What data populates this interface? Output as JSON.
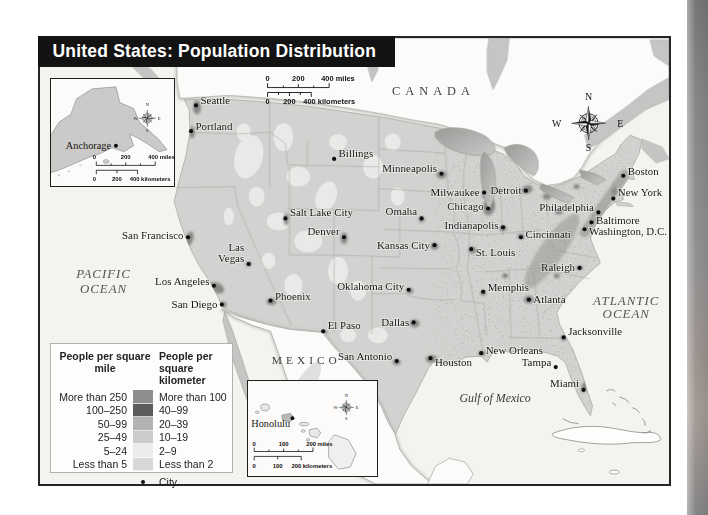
{
  "title": "United States: Population Distribution",
  "compass": {
    "n": "N",
    "e": "E",
    "s": "S",
    "w": "W"
  },
  "map": {
    "region_labels": {
      "canada": "CANADA",
      "mexico": "MEXICO",
      "pacific_1": "PACIFIC",
      "pacific_2": "OCEAN",
      "atlantic_1": "ATLANTIC",
      "atlantic_2": "OCEAN",
      "gulf": "Gulf of Mexico"
    },
    "scale": {
      "mi": [
        "0",
        "200",
        "400 miles"
      ],
      "km": [
        "0",
        "200",
        "400 kilometers"
      ]
    },
    "cities": [
      {
        "name": "Seattle",
        "x": 157,
        "y": 68,
        "side": "right",
        "dy": -1
      },
      {
        "name": "Portland",
        "x": 152,
        "y": 94,
        "side": "right",
        "dy": -1
      },
      {
        "name": "Billings",
        "x": 296,
        "y": 122,
        "side": "right",
        "dy": -2
      },
      {
        "name": "Minneapolis",
        "x": 404,
        "y": 137,
        "side": "left",
        "dy": -2
      },
      {
        "name": "Milwaukee",
        "x": 447,
        "y": 156,
        "side": "left"
      },
      {
        "name": "Detroit",
        "x": 489,
        "y": 154,
        "side": "left"
      },
      {
        "name": "Chicago",
        "x": 451,
        "y": 172,
        "side": "left",
        "dy": 2
      },
      {
        "name": "Omaha",
        "x": 384,
        "y": 182,
        "side": "left",
        "dy": -3
      },
      {
        "name": "Salt Lake City",
        "x": 247,
        "y": 182,
        "side": "right",
        "dy": -2
      },
      {
        "name": "Denver",
        "x": 306,
        "y": 201,
        "side": "left",
        "dy": -2
      },
      {
        "name": "San Francisco",
        "x": 149,
        "y": 201,
        "side": "left",
        "dy": 2
      },
      {
        "name": "Las Vegas",
        "x": 210,
        "y": 228,
        "side": "left",
        "dy": -13,
        "lines": [
          "Las",
          "Vegas"
        ]
      },
      {
        "name": "Los Angeles",
        "x": 175,
        "y": 250,
        "side": "left",
        "dy": -1
      },
      {
        "name": "San Diego",
        "x": 183,
        "y": 269,
        "side": "left"
      },
      {
        "name": "Phoenix",
        "x": 232,
        "y": 265,
        "side": "right",
        "dy": -1
      },
      {
        "name": "Kansas City",
        "x": 397,
        "y": 209,
        "side": "left"
      },
      {
        "name": "Indianapolis",
        "x": 466,
        "y": 191,
        "side": "left",
        "dy": 2
      },
      {
        "name": "Cincinnati",
        "x": 484,
        "y": 201,
        "side": "right",
        "dy": 1
      },
      {
        "name": "St. Louis",
        "x": 434,
        "y": 213,
        "side": "right",
        "dy": 7
      },
      {
        "name": "Philadelphia",
        "x": 562,
        "y": 176,
        "side": "left",
        "dy": -1
      },
      {
        "name": "New York",
        "x": 577,
        "y": 162,
        "side": "right",
        "dy": -3
      },
      {
        "name": "Boston",
        "x": 587,
        "y": 139,
        "side": "right",
        "dy": -1
      },
      {
        "name": "Baltimore",
        "x": 555,
        "y": 186,
        "side": "right",
        "dy": 2
      },
      {
        "name": "Washington, D.C.",
        "x": 548,
        "y": 193,
        "side": "right",
        "dy": 6
      },
      {
        "name": "Raleigh",
        "x": 543,
        "y": 232,
        "side": "left"
      },
      {
        "name": "Oklahoma City",
        "x": 371,
        "y": 254,
        "side": "left",
        "dy": 0
      },
      {
        "name": "Memphis",
        "x": 446,
        "y": 256,
        "side": "right",
        "dy": -1
      },
      {
        "name": "Atlanta",
        "x": 492,
        "y": 264,
        "side": "right"
      },
      {
        "name": "El Paso",
        "x": 285,
        "y": 296,
        "side": "right",
        "dy": -2
      },
      {
        "name": "Dallas",
        "x": 376,
        "y": 287,
        "side": "left"
      },
      {
        "name": "San Antonio",
        "x": 359,
        "y": 326,
        "side": "left",
        "dy": -1
      },
      {
        "name": "Houston",
        "x": 393,
        "y": 323,
        "side": "right",
        "dy": 8
      },
      {
        "name": "New Orleans",
        "x": 444,
        "y": 318,
        "side": "right",
        "dy": 1
      },
      {
        "name": "Jacksonville",
        "x": 527,
        "y": 302,
        "side": "right",
        "dy": -2
      },
      {
        "name": "Tampa",
        "x": 519,
        "y": 332,
        "side": "left",
        "dy": -1
      },
      {
        "name": "Miami",
        "x": 547,
        "y": 355,
        "side": "left",
        "dy": -3
      }
    ]
  },
  "insets": {
    "alaska": {
      "city": "Anchorage",
      "scale_mi": [
        "0",
        "200",
        "400 miles"
      ],
      "scale_km": [
        "0",
        "200",
        "400 kilometers"
      ]
    },
    "hawaii": {
      "city": "Honolulu",
      "scale_mi": [
        "0",
        "100",
        "200 miles"
      ],
      "scale_km": [
        "0",
        "100",
        "200 kilometers"
      ]
    }
  },
  "legend": {
    "col1_header": "People per square mile",
    "col2_header": "People per square kilometer",
    "rows": [
      {
        "mile": "More than 250",
        "km": "More than 100",
        "color": "#8e8e8c"
      },
      {
        "mile": "100–250",
        "km": "40–99",
        "color": "#5c5c5a"
      },
      {
        "mile": "50–99",
        "km": "20–39",
        "color": "#b3b3b1"
      },
      {
        "mile": "25–49",
        "km": "10–19",
        "color": "#cdccca"
      },
      {
        "mile": "5–24",
        "km": "2–9",
        "color": "#edecea"
      },
      {
        "mile": "Less than 5",
        "km": "Less than 2",
        "color": "#d9d8d6"
      }
    ],
    "city_label": "City"
  }
}
